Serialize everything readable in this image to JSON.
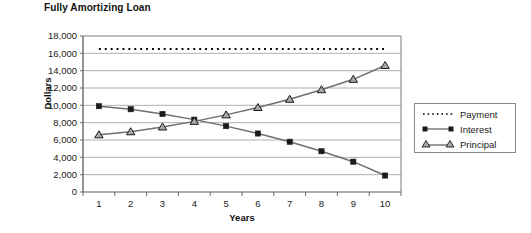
{
  "chart_data": {
    "type": "line",
    "title": "Fully Amortizing Loan",
    "xlabel": "Years",
    "ylabel": "Dollars",
    "x": [
      1,
      2,
      3,
      4,
      5,
      6,
      7,
      8,
      9,
      10
    ],
    "xtick_labels": [
      "1",
      "2",
      "3",
      "4",
      "5",
      "6",
      "7",
      "8",
      "9",
      "10"
    ],
    "ytick_labels": [
      "0",
      "2,000",
      "4,000",
      "6,000",
      "8,000",
      "10,000",
      "12,000",
      "14,000",
      "16,000",
      "18,000"
    ],
    "ytick_values": [
      0,
      2000,
      4000,
      6000,
      8000,
      10000,
      12000,
      14000,
      16000,
      18000
    ],
    "ylim": [
      0,
      18000
    ],
    "xlim": [
      0.5,
      10.5
    ],
    "grid": "horizontal",
    "legend_position": "right",
    "series": [
      {
        "name": "Payment",
        "style": "dotted",
        "marker": "none",
        "color": "#000000",
        "values": [
          16500,
          16500,
          16500,
          16500,
          16500,
          16500,
          16500,
          16500,
          16500,
          16500
        ]
      },
      {
        "name": "Interest",
        "style": "solid",
        "marker": "square",
        "color": "#6e6e6e",
        "marker_color": "#1a1a1a",
        "values": [
          9900,
          9550,
          9000,
          8350,
          7600,
          6750,
          5800,
          4700,
          3500,
          1900
        ]
      },
      {
        "name": "Principal",
        "style": "solid",
        "marker": "triangle",
        "color": "#6e6e6e",
        "marker_color": "#a8a8a8",
        "values": [
          6600,
          6950,
          7500,
          8150,
          8900,
          9750,
          10700,
          11800,
          13000,
          14600
        ]
      }
    ]
  },
  "legend": {
    "items": [
      {
        "label": "Payment"
      },
      {
        "label": "Interest"
      },
      {
        "label": "Principal"
      }
    ]
  },
  "colors": {
    "gridline": "#9a9a9a",
    "axis": "#5a5a5a",
    "plot_border": "#6a6a6a",
    "text": "#1a1a1a"
  }
}
